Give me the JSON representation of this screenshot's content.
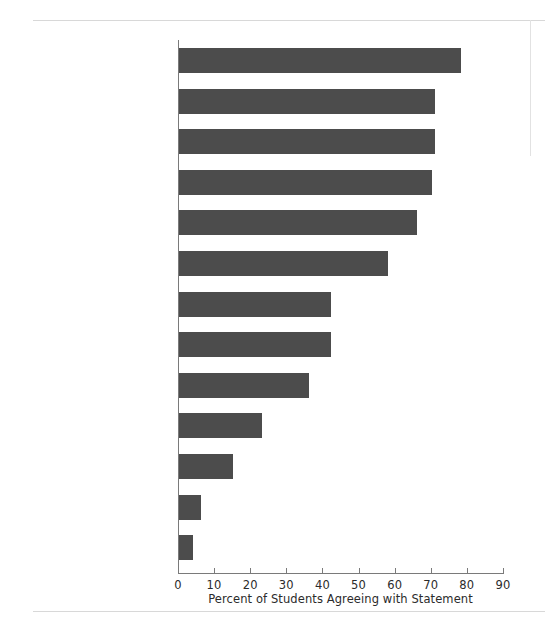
{
  "chart_data": {
    "type": "bar",
    "orientation": "horizontal",
    "title": "",
    "subtitle": "",
    "xlabel": "Percent of Students Agreeing with Statement",
    "ylabel": "",
    "xlim": [
      0,
      90
    ],
    "xticks": [
      0,
      10,
      20,
      30,
      40,
      50,
      60,
      70,
      80,
      90
    ],
    "xtick_labels": [
      "0",
      "10",
      "20",
      "30",
      "40",
      "50",
      "60",
      "70",
      "80",
      "90"
    ],
    "grid": false,
    "legend": false,
    "bar_color": "#4c4c4c",
    "axis_color": "#7a7a7a",
    "categories": [
      "To learn more about things that interest me",
      "To be able to get a better job",
      "To be able to make more money",
      "To get training for a specific career",
      "To gain a general education and appreciation of ideas",
      "To prepare myself for graduate or professional school",
      "To find my purpose in life",
      "My parents wanted me to go",
      "To make me a more cultured person",
      "Wanted to get away from home",
      "A mentor/role model encouraged me to go",
      "I could not find a job",
      "There was nothing better to do"
    ],
    "values": [
      78,
      71,
      71,
      70,
      66,
      58,
      42,
      42,
      36,
      23,
      15,
      6,
      4
    ]
  },
  "rows": [
    {
      "label_lines": [
        "To learn more about",
        "things that interest me"
      ],
      "value": 78
    },
    {
      "label_lines": [
        "To be able to get",
        "a better job"
      ],
      "value": 71
    },
    {
      "label_lines": [
        "To be able to make",
        "more money"
      ],
      "value": 71
    },
    {
      "label_lines": [
        "To get training for",
        "a specific career"
      ],
      "value": 70
    },
    {
      "label_lines": [
        "To gain a general education",
        "and appreciation of ideas"
      ],
      "value": 66
    },
    {
      "label_lines": [
        "To prepare myself",
        "for graduate or",
        "professional school"
      ],
      "value": 58
    },
    {
      "label_lines": [
        "To find my",
        "purpose in life"
      ],
      "value": 42
    },
    {
      "label_lines": [
        "My parents wanted",
        "me to go"
      ],
      "value": 42
    },
    {
      "label_lines": [
        "To make me a more",
        "cultured person"
      ],
      "value": 36
    },
    {
      "label_lines": [
        "Wanted to get",
        "away from home"
      ],
      "value": 23
    },
    {
      "label_lines": [
        "A mentor/role model",
        "encouraged me to go"
      ],
      "value": 15
    },
    {
      "label_lines": [
        "I could not find a job"
      ],
      "value": 6
    },
    {
      "label_lines": [
        "There was nothing",
        "better to do"
      ],
      "value": 4
    }
  ],
  "axis": {
    "x_label": "Percent of Students Agreeing with Statement",
    "ticks": [
      "0",
      "10",
      "20",
      "30",
      "40",
      "50",
      "60",
      "70",
      "80",
      "90"
    ]
  }
}
